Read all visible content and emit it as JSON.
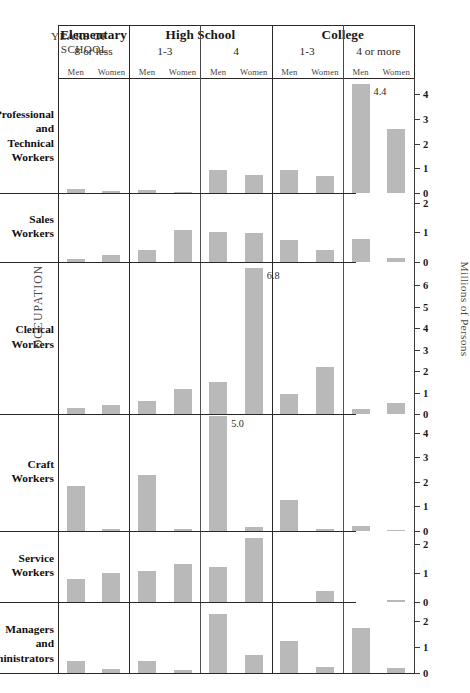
{
  "chart_data": {
    "type": "bar",
    "title": "",
    "xlabel": "YEARS OF SCHOOL",
    "ylabel": "Millions of Persons",
    "grid": false,
    "legend": "none",
    "orientation": "vertical",
    "layout": "small-multiples grid: rows = occupation, columns = years of school x sex",
    "column_groups": [
      {
        "group": "Elementary",
        "sub": "8 or less",
        "genders": [
          "Men",
          "Women"
        ]
      },
      {
        "group": "High School",
        "sub": "1-3",
        "genders": [
          "Men",
          "Women"
        ]
      },
      {
        "group": "High School",
        "sub": "4",
        "genders": [
          "Men",
          "Women"
        ]
      },
      {
        "group": "College",
        "sub": "1-3",
        "genders": [
          "Men",
          "Women"
        ]
      },
      {
        "group": "College",
        "sub": "4 or more",
        "genders": [
          "Men",
          "Women"
        ]
      }
    ],
    "categories": [
      "Elementary 8 or less - Men",
      "Elementary 8 or less - Women",
      "High School 1-3 - Men",
      "High School 1-3 - Women",
      "High School 4 - Men",
      "High School 4 - Women",
      "College 1-3 - Men",
      "College 1-3 - Women",
      "College 4 or more - Men",
      "College 4 or more - Women"
    ],
    "rows": [
      {
        "occupation": "Professional and Technical Workers",
        "ymax": 4.5,
        "ticks": [
          0,
          1,
          2,
          3,
          4
        ],
        "values": [
          0.15,
          0.08,
          0.12,
          0.06,
          0.95,
          0.75,
          0.95,
          0.7,
          4.4,
          2.6
        ],
        "labels": {
          "8": "4.4"
        }
      },
      {
        "occupation": "Sales Workers",
        "ymax": 2.2,
        "ticks": [
          0,
          1,
          2
        ],
        "values": [
          0.1,
          0.25,
          0.4,
          1.1,
          1.0,
          0.98,
          0.75,
          0.42,
          0.78,
          0.12
        ]
      },
      {
        "occupation": "Clerical Workers",
        "ymax": 6.9,
        "ticks": [
          0,
          1,
          2,
          3,
          4,
          5,
          6
        ],
        "values": [
          0.3,
          0.4,
          0.62,
          1.15,
          1.5,
          6.8,
          0.95,
          2.2,
          0.25,
          0.5
        ],
        "labels": {
          "5": "6.8"
        }
      },
      {
        "occupation": "Craft Workers",
        "ymax": 4.6,
        "ticks": [
          0,
          1,
          2,
          3,
          4
        ],
        "values": [
          1.85,
          0.1,
          2.3,
          0.08,
          5.0,
          0.18,
          1.25,
          0.08,
          0.2,
          0.05
        ],
        "labels": {
          "4": "5.0"
        }
      },
      {
        "occupation": "Service Workers",
        "ymax": 2.3,
        "ticks": [
          0,
          1,
          2
        ],
        "values": [
          0.78,
          1.0,
          1.05,
          1.3,
          1.2,
          2.2,
          0.0,
          0.38,
          0.0,
          0.08
        ]
      },
      {
        "occupation": "Managers and Administrators",
        "ymax": 2.6,
        "ticks": [
          0,
          1,
          2
        ],
        "values": [
          0.45,
          0.15,
          0.48,
          0.12,
          2.3,
          0.68,
          1.25,
          0.22,
          1.75,
          0.2
        ]
      }
    ]
  },
  "header": {
    "years_of_school_line1": "YEARS OF",
    "years_of_school_line2": "SCHOOL",
    "groups": [
      {
        "title": "Elementary",
        "sub": "8 or less",
        "men": "Men",
        "women": "Women"
      },
      {
        "title": "High School",
        "sub": "1-3",
        "men": "Men",
        "women": "Women"
      },
      {
        "title": "",
        "sub": "4",
        "men": "Men",
        "women": "Women"
      },
      {
        "title": "College",
        "sub": "1-3",
        "men": "Men",
        "women": "Women"
      },
      {
        "title": "",
        "sub": "4 or more",
        "men": "Men",
        "women": "Women"
      }
    ]
  },
  "side_labels": {
    "occupation": "OCCUPATION",
    "millions": "Millions of Persons"
  },
  "caption": "",
  "colors": {
    "bar": "#b9b9b9",
    "rule": "#2b2727",
    "text": "#1a1717",
    "muted": "#4d4848"
  }
}
